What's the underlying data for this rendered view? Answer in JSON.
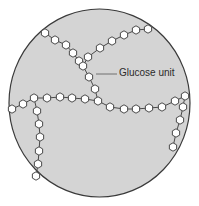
{
  "diagram": {
    "title": "",
    "label": "Glucose unit",
    "colors": {
      "background": "#ffffff",
      "circle_fill": "#d4d4d4",
      "circle_stroke": "#3a3a3a",
      "unit_fill": "#ffffff",
      "unit_stroke": "#4a4a4a",
      "leader_line": "#555555"
    },
    "circle": {
      "cx": 99.5,
      "cy": 103,
      "rx": 90.5,
      "ry": 94
    },
    "leader": {
      "x1": 96,
      "y1": 74,
      "x2": 117,
      "y2": 74
    },
    "unit_radius": 4.2,
    "chains": [
      {
        "name": "top-left-branch",
        "units": [
          [
            45,
            33
          ],
          [
            55,
            40
          ],
          [
            66,
            45
          ],
          [
            73,
            53
          ],
          [
            79,
            61
          ],
          [
            83,
            66
          ]
        ]
      },
      {
        "name": "top-right-branch",
        "units": [
          [
            88,
            57
          ],
          [
            100,
            48
          ],
          [
            112,
            41
          ],
          [
            124,
            35
          ],
          [
            136,
            30
          ],
          [
            148,
            29
          ]
        ]
      },
      {
        "name": "central-trunk",
        "units": [
          [
            89,
            77
          ],
          [
            95,
            89
          ],
          [
            98,
            101
          ]
        ]
      },
      {
        "name": "horizontal-left",
        "units": [
          [
            12,
            109
          ],
          [
            23,
            104
          ],
          [
            34,
            98
          ],
          [
            47,
            98
          ],
          [
            60,
            97
          ],
          [
            72,
            98
          ],
          [
            85,
            99
          ]
        ]
      },
      {
        "name": "horizontal-right",
        "units": [
          [
            110,
            107
          ],
          [
            124,
            109
          ],
          [
            136,
            109
          ],
          [
            149,
            108
          ],
          [
            162,
            107
          ],
          [
            175,
            101
          ],
          [
            185,
            96
          ]
        ]
      },
      {
        "name": "left-vertical-branch",
        "units": [
          [
            37,
            111
          ],
          [
            39,
            124
          ],
          [
            40,
            137
          ],
          [
            39,
            151
          ],
          [
            38,
            164
          ],
          [
            36,
            176
          ]
        ]
      },
      {
        "name": "right-vertical-branch",
        "units": [
          [
            183,
            107
          ],
          [
            180,
            120
          ],
          [
            176,
            133
          ],
          [
            173,
            147
          ]
        ]
      }
    ]
  }
}
